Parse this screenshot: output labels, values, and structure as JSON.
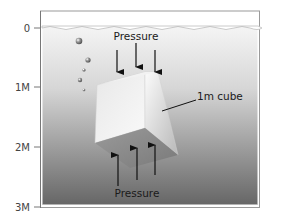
{
  "diagram": {
    "depth_axis": {
      "ticks": [
        {
          "label": "0",
          "y": 28
        },
        {
          "label": "1M",
          "y": 87
        },
        {
          "label": "2M",
          "y": 147
        },
        {
          "label": "3M",
          "y": 207
        }
      ]
    },
    "labels": {
      "pressure_top": "Pressure",
      "pressure_bottom": "Pressure",
      "cube": "1m cube"
    },
    "colors": {
      "water_top": "#f4f4f4",
      "water_bottom": "#6a6a6a",
      "arrow": "#111111",
      "axis": "#777777"
    }
  }
}
